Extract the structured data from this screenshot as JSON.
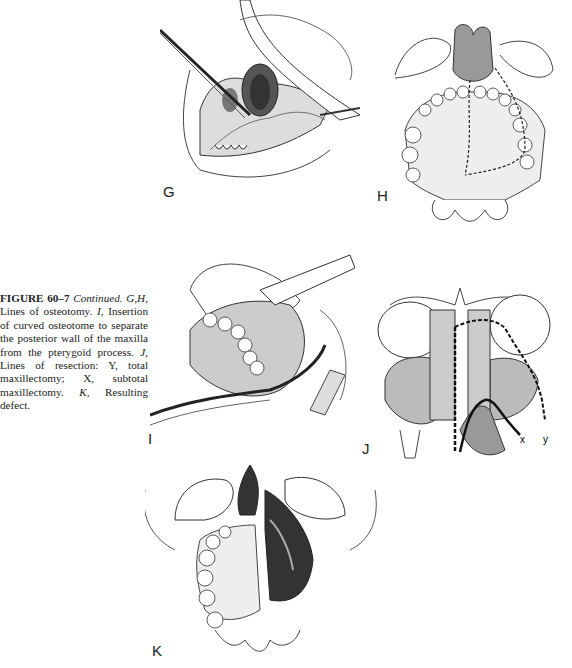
{
  "figure": {
    "number": "FIGURE 60–7",
    "continued": "Continued.",
    "caption_parts": [
      {
        "text": "G,H",
        "style": "italic"
      },
      {
        "text": ", Lines of osteotomy. ",
        "style": "normal"
      },
      {
        "text": "I",
        "style": "italic"
      },
      {
        "text": ", Insertion of curved osteotome to separate the posterior wall of the maxilla from the pterygoid process. ",
        "style": "normal"
      },
      {
        "text": "J",
        "style": "italic"
      },
      {
        "text": ", Lines of resection: Y, total maxillectomy; X, subtotal maxillectomy. ",
        "style": "normal"
      },
      {
        "text": "K",
        "style": "italic"
      },
      {
        "text": ", Resulting defect.",
        "style": "normal"
      }
    ]
  },
  "panels": {
    "G": {
      "label": "G",
      "description": "Osteotomy through oral approach with osteotome and retractor"
    },
    "H": {
      "label": "H",
      "description": "Palatal view with dashed osteotomy lines"
    },
    "I": {
      "label": "I",
      "description": "Curved osteotome inserted behind maxilla"
    },
    "J": {
      "label": "J",
      "description": "Coronal section with resection lines",
      "line_labels": [
        "x",
        "y"
      ]
    },
    "K": {
      "label": "K",
      "description": "Resulting maxillectomy defect"
    }
  }
}
